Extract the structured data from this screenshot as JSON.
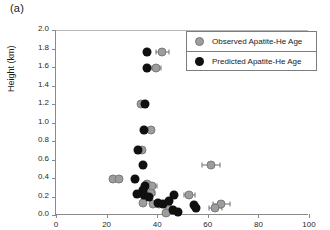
{
  "figure": {
    "panel_label": "(a)"
  },
  "legend": {
    "position": "top-right",
    "entries": [
      {
        "label": "Observed Apatite-He Age",
        "color": "#9d9d9d",
        "marker": "filled-circle-gray"
      },
      {
        "label": "Predicted Apatite-He Age",
        "color": "#101010",
        "marker": "filled-circle-black"
      }
    ]
  },
  "axes": {
    "x_tick_labels": [
      "0",
      "20",
      "40",
      "60",
      "80",
      "100"
    ],
    "y_tick_labels": [
      "0.0",
      "0.2",
      "0.4",
      "0.6",
      "0.8",
      "1.0",
      "1.2",
      "1.4",
      "1.6",
      "1.8",
      "2.0"
    ],
    "ylabel": "Height (km)",
    "xlabel": ""
  },
  "chart_data": {
    "type": "scatter",
    "title": "",
    "xlabel": "",
    "ylabel": "Height (km)",
    "xlim": [
      0,
      100
    ],
    "ylim": [
      0.0,
      2.0
    ],
    "xticks": [
      0,
      20,
      40,
      60,
      80,
      100
    ],
    "yticks": [
      0.0,
      0.2,
      0.4,
      0.6,
      0.8,
      1.0,
      1.2,
      1.4,
      1.6,
      1.8,
      2.0
    ],
    "grid": false,
    "legend_position": "upper right",
    "series": [
      {
        "name": "Observed Apatite-He Age",
        "color": "#9d9d9d",
        "marker": "o",
        "points": [
          {
            "x": 42.0,
            "y": 1.76,
            "xerr": 2.6
          },
          {
            "x": 39.6,
            "y": 1.59,
            "xerr": 1.8
          },
          {
            "x": 33.4,
            "y": 1.2,
            "xerr": 0.0
          },
          {
            "x": 37.4,
            "y": 0.92,
            "xerr": 0.0
          },
          {
            "x": 34.0,
            "y": 0.7,
            "xerr": 0.0
          },
          {
            "x": 61.2,
            "y": 0.54,
            "xerr": 3.6
          },
          {
            "x": 22.6,
            "y": 0.39,
            "xerr": 0.0
          },
          {
            "x": 25.0,
            "y": 0.39,
            "xerr": 0.0
          },
          {
            "x": 36.0,
            "y": 0.33,
            "xerr": 0.0
          },
          {
            "x": 38.0,
            "y": 0.31,
            "xerr": 1.8
          },
          {
            "x": 37.4,
            "y": 0.24,
            "xerr": 1.8
          },
          {
            "x": 52.6,
            "y": 0.22,
            "xerr": 2.2
          },
          {
            "x": 34.2,
            "y": 0.13,
            "xerr": 0.0
          },
          {
            "x": 38.4,
            "y": 0.12,
            "xerr": 0.0
          },
          {
            "x": 40.6,
            "y": 0.12,
            "xerr": 1.6
          },
          {
            "x": 65.4,
            "y": 0.12,
            "xerr": 3.2
          },
          {
            "x": 63.0,
            "y": 0.08,
            "xerr": 2.6
          },
          {
            "x": 44.6,
            "y": 0.06,
            "xerr": 0.0
          },
          {
            "x": 43.4,
            "y": 0.02,
            "xerr": 0.0
          }
        ]
      },
      {
        "name": "Predicted Apatite-He Age",
        "color": "#101010",
        "marker": "o",
        "points": [
          {
            "x": 35.8,
            "y": 1.76
          },
          {
            "x": 36.0,
            "y": 1.59
          },
          {
            "x": 35.2,
            "y": 1.2
          },
          {
            "x": 34.6,
            "y": 0.92
          },
          {
            "x": 32.6,
            "y": 0.7
          },
          {
            "x": 34.4,
            "y": 0.54
          },
          {
            "x": 31.4,
            "y": 0.39
          },
          {
            "x": 35.2,
            "y": 0.31
          },
          {
            "x": 34.2,
            "y": 0.27
          },
          {
            "x": 32.0,
            "y": 0.23
          },
          {
            "x": 34.6,
            "y": 0.22
          },
          {
            "x": 46.8,
            "y": 0.22
          },
          {
            "x": 36.6,
            "y": 0.19
          },
          {
            "x": 44.6,
            "y": 0.15
          },
          {
            "x": 40.4,
            "y": 0.13
          },
          {
            "x": 42.2,
            "y": 0.12
          },
          {
            "x": 54.6,
            "y": 0.11
          },
          {
            "x": 55.2,
            "y": 0.08
          },
          {
            "x": 46.2,
            "y": 0.05
          },
          {
            "x": 48.2,
            "y": 0.03
          }
        ]
      }
    ]
  }
}
